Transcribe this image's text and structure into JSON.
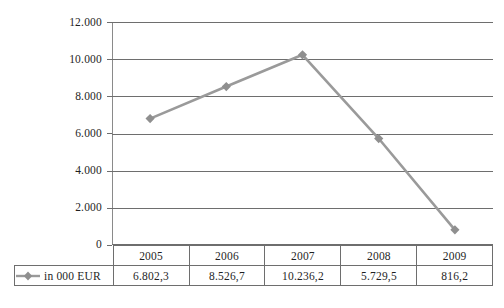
{
  "chart_data": {
    "type": "line",
    "title": "",
    "xlabel": "",
    "ylabel": "",
    "categories": [
      "2005",
      "2006",
      "2007",
      "2008",
      "2009"
    ],
    "values": [
      6802.3,
      8526.7,
      10236.2,
      5729.5,
      816.2
    ],
    "value_labels": [
      "6.802,3",
      "8.526,7",
      "10.236,2",
      "5.729,5",
      "816,2"
    ],
    "series": [
      {
        "name": "in 000 EUR",
        "values": [
          6802.3,
          8526.7,
          10236.2,
          5729.5,
          816.2
        ],
        "color": "#9a9a9a",
        "marker": "diamond"
      }
    ],
    "ylim": [
      0,
      12000
    ],
    "y_ticks": [
      0,
      2000,
      4000,
      6000,
      8000,
      10000,
      12000
    ],
    "y_tick_labels": [
      "0",
      "2.000",
      "4.000",
      "6.000",
      "8.000",
      "10.000",
      "12.000"
    ],
    "grid": "horizontal",
    "legend_position": "bottom-table",
    "number_format": "european (. thousands, , decimal)"
  },
  "axis": {
    "y_tick_labels": [
      "12.000",
      "10.000",
      "8.000",
      "6.000",
      "4.000",
      "2.000",
      "0"
    ]
  },
  "table": {
    "legend_label": "in 000 EUR",
    "header_row": [
      "2005",
      "2006",
      "2007",
      "2008",
      "2009"
    ],
    "value_row": [
      "6.802,3",
      "8.526,7",
      "10.236,2",
      "5.729,5",
      "816,2"
    ]
  },
  "caption": {
    "text": ""
  },
  "colors": {
    "series": "#9a9a9a",
    "marker": "#8f8f8f",
    "gridline": "#6e6e6e",
    "axis": "#8a8a8a",
    "text": "#1f1f1f"
  }
}
